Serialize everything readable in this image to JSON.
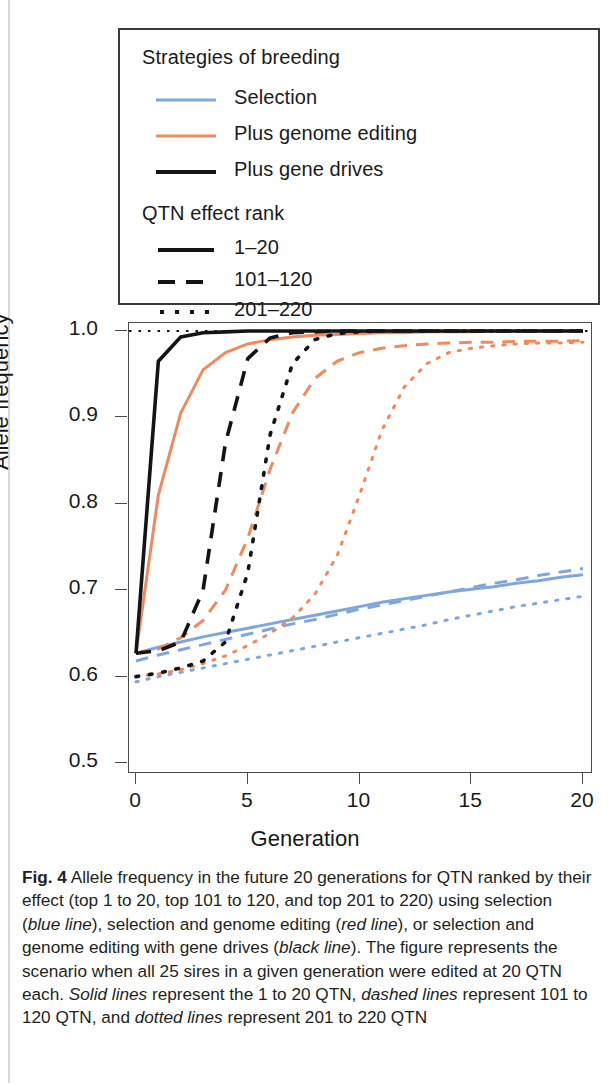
{
  "figure": {
    "label": "Fig. 4",
    "caption_segments": [
      {
        "text": "Fig. 4",
        "style": "bold"
      },
      {
        "text": " Allele frequency in the future 20 generations for QTN ranked by their effect (top 1 to 20, top 101 to 120, and top 201 to 220) using selection (",
        "style": "normal"
      },
      {
        "text": "blue line",
        "style": "italic"
      },
      {
        "text": "), selection and genome editing (",
        "style": "normal"
      },
      {
        "text": "red line",
        "style": "italic"
      },
      {
        "text": "), or selection and genome editing with gene drives (",
        "style": "normal"
      },
      {
        "text": "black line",
        "style": "italic"
      },
      {
        "text": "). The figure represents the scenario when all 25 sires in a given generation were edited at 20 QTN each. ",
        "style": "normal"
      },
      {
        "text": "Solid lines",
        "style": "italic"
      },
      {
        "text": " represent the 1 to 20 QTN, ",
        "style": "normal"
      },
      {
        "text": "dashed lines",
        "style": "italic"
      },
      {
        "text": " represent 101 to 120 QTN, and ",
        "style": "normal"
      },
      {
        "text": "dotted lines",
        "style": "italic"
      },
      {
        "text": " represent 201 to 220 QTN",
        "style": "normal"
      }
    ]
  },
  "legend": {
    "group1_title": "Strategies of breeding",
    "group1_items": [
      {
        "label": "Selection",
        "color": "#7fa7dd",
        "style": "solid"
      },
      {
        "label": "Plus genome editing",
        "color": "#ef8a5c",
        "style": "solid"
      },
      {
        "label": "Plus gene drives",
        "color": "#141414",
        "style": "solid"
      }
    ],
    "group2_title": "QTN effect rank",
    "group2_items": [
      {
        "label": "1–20",
        "color": "#141414",
        "style": "solid"
      },
      {
        "label": "101–120",
        "color": "#141414",
        "style": "dashed"
      },
      {
        "label": "201–220",
        "color": "#141414",
        "style": "dotted"
      }
    ]
  },
  "chart_data": {
    "type": "line",
    "title": "",
    "xlabel": "Generation",
    "ylabel": "Allele frequency",
    "xlim": [
      0,
      20
    ],
    "ylim": [
      0.5,
      1.0
    ],
    "xticks": [
      0,
      5,
      10,
      15,
      20
    ],
    "yticks": [
      "0.5",
      "0.6",
      "0.7",
      "0.8",
      "0.9",
      "1.0"
    ],
    "grid": false,
    "legend_position": "above-plot",
    "reference_line": {
      "y": 1.0,
      "style": "dotted",
      "color": "#141414"
    },
    "x": [
      0,
      1,
      2,
      3,
      4,
      5,
      6,
      7,
      8,
      9,
      10,
      11,
      12,
      13,
      14,
      15,
      16,
      17,
      18,
      19,
      20
    ],
    "series": [
      {
        "name": "Plus gene drives — 1–20",
        "color": "#141414",
        "style": "solid",
        "values": [
          0.627,
          0.965,
          0.993,
          0.998,
          0.999,
          1.0,
          1.0,
          1.0,
          1.0,
          1.0,
          1.0,
          1.0,
          1.0,
          1.0,
          1.0,
          1.0,
          1.0,
          1.0,
          1.0,
          1.0,
          1.0
        ]
      },
      {
        "name": "Plus gene drives — 101–120",
        "color": "#141414",
        "style": "dashed",
        "values": [
          0.627,
          0.63,
          0.64,
          0.7,
          0.87,
          0.968,
          0.992,
          0.998,
          0.999,
          1.0,
          1.0,
          1.0,
          1.0,
          1.0,
          1.0,
          1.0,
          1.0,
          1.0,
          1.0,
          1.0,
          1.0
        ]
      },
      {
        "name": "Plus gene drives — 201–220",
        "color": "#141414",
        "style": "dotted",
        "values": [
          0.6,
          0.604,
          0.61,
          0.618,
          0.64,
          0.72,
          0.88,
          0.962,
          0.99,
          0.997,
          0.999,
          1.0,
          1.0,
          1.0,
          1.0,
          1.0,
          1.0,
          1.0,
          1.0,
          1.0,
          1.0
        ]
      },
      {
        "name": "Plus genome editing — 1–20",
        "color": "#ef8a5c",
        "style": "solid",
        "values": [
          0.627,
          0.81,
          0.905,
          0.955,
          0.975,
          0.985,
          0.99,
          0.993,
          0.995,
          0.996,
          0.997,
          0.998,
          0.998,
          0.999,
          0.999,
          0.999,
          1.0,
          1.0,
          1.0,
          1.0,
          1.0
        ]
      },
      {
        "name": "Plus genome editing — 101–120",
        "color": "#ef8a5c",
        "style": "dashed",
        "values": [
          0.627,
          0.632,
          0.645,
          0.665,
          0.7,
          0.76,
          0.84,
          0.905,
          0.945,
          0.965,
          0.975,
          0.98,
          0.983,
          0.985,
          0.986,
          0.987,
          0.987,
          0.988,
          0.988,
          0.988,
          0.989
        ]
      },
      {
        "name": "Plus genome editing — 201–220",
        "color": "#ef8a5c",
        "style": "dotted",
        "values": [
          0.6,
          0.603,
          0.608,
          0.615,
          0.624,
          0.636,
          0.65,
          0.668,
          0.695,
          0.74,
          0.81,
          0.885,
          0.935,
          0.962,
          0.975,
          0.98,
          0.983,
          0.985,
          0.986,
          0.986,
          0.987
        ]
      },
      {
        "name": "Selection — 1–20",
        "color": "#7fa7dd",
        "style": "solid",
        "values": [
          0.627,
          0.634,
          0.64,
          0.646,
          0.651,
          0.656,
          0.661,
          0.666,
          0.671,
          0.676,
          0.681,
          0.686,
          0.69,
          0.694,
          0.698,
          0.701,
          0.704,
          0.708,
          0.711,
          0.715,
          0.718
        ]
      },
      {
        "name": "Selection — 101–120",
        "color": "#7fa7dd",
        "style": "dashed",
        "values": [
          0.618,
          0.625,
          0.631,
          0.637,
          0.643,
          0.649,
          0.655,
          0.661,
          0.666,
          0.672,
          0.678,
          0.683,
          0.688,
          0.693,
          0.698,
          0.703,
          0.708,
          0.712,
          0.717,
          0.721,
          0.725
        ]
      },
      {
        "name": "Selection — 201–220",
        "color": "#7fa7dd",
        "style": "dotted",
        "values": [
          0.594,
          0.6,
          0.605,
          0.61,
          0.615,
          0.62,
          0.625,
          0.63,
          0.635,
          0.64,
          0.645,
          0.65,
          0.655,
          0.66,
          0.666,
          0.671,
          0.676,
          0.681,
          0.685,
          0.689,
          0.693
        ]
      }
    ]
  }
}
